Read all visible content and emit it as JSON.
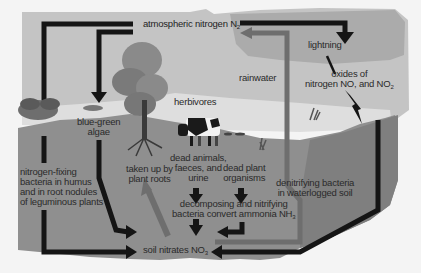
{
  "diagram": {
    "type": "cycle",
    "labels": {
      "atmospheric_nitrogen": "atmospheric nitrogen N",
      "atmospheric_nitrogen_sub": "2",
      "lightning": "lightning",
      "oxides_line1": "oxides of",
      "oxides_line2": "nitrogen NO, and NO",
      "oxides_sub": "2",
      "rainwater": "rainwater",
      "blue_green_line1": "blue-green",
      "blue_green_line2": "algae",
      "herbivores": "herbivores",
      "nitrogen_fixing_line1": "nitrogen-fixing",
      "nitrogen_fixing_line2": "bacteria in humus",
      "nitrogen_fixing_line3": "and in root nodules",
      "nitrogen_fixing_line4": "of leguminous plants",
      "taken_up_line1": "taken up by",
      "taken_up_line2": "plant roots",
      "dead_animals_line1": "dead animals,",
      "dead_animals_line2": "faeces, and",
      "dead_animals_line3": "urine",
      "dead_plant_line1": "dead plant",
      "dead_plant_line2": "organisms",
      "decomposing_line1": "decomposing and nitrifying",
      "decomposing_line2": "bacteria convert ammonia NH",
      "decomposing_sub": "3",
      "denitrifying_line1": "denitrifying bacteria",
      "denitrifying_line2": "in waterlogged soil",
      "soil_nitrates": "soil nitrates NO",
      "soil_nitrates_sub": "3"
    },
    "nodes": [
      "atmospheric nitrogen N2",
      "lightning",
      "oxides of nitrogen NO and NO2",
      "rainwater",
      "blue-green algae",
      "herbivores",
      "nitrogen-fixing bacteria",
      "plant roots",
      "dead animals, faeces, and urine",
      "dead plant organisms",
      "decomposing and nitrifying bacteria",
      "soil nitrates NO3",
      "denitrifying bacteria"
    ],
    "colors": {
      "sky": "#c4c4c4",
      "cloud": "#a9a9a9",
      "ground": "#dedede",
      "soil": "#8f8f8f",
      "arrow": "#151515",
      "arrow_gray": "#6e6e6e"
    }
  }
}
